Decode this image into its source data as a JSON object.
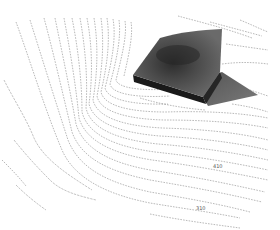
{
  "figure": {
    "contour_labels": [
      {
        "text": "410",
        "x": 216,
        "y": 167
      },
      {
        "text": "310",
        "x": 196,
        "y": 209
      }
    ],
    "colors": {
      "background": "#ffffff",
      "contour": "#8a8a8a",
      "block_top": "#5e5e5e",
      "block_dark_patch": "#2e2e2e",
      "block_side": "#1c1c1c",
      "block_base": "#6f6f6f"
    }
  }
}
